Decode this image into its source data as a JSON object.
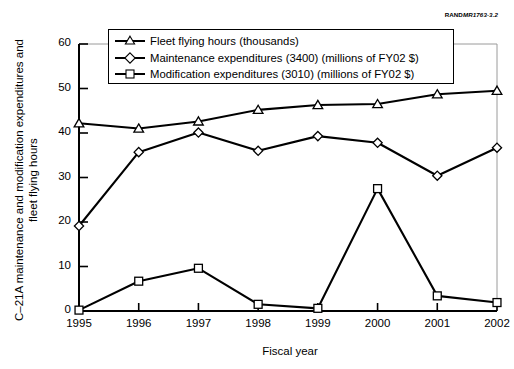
{
  "figure": {
    "source_tag_bold": "RAND",
    "source_tag_italic": "MR1763-3.2"
  },
  "chart_data": {
    "type": "line",
    "title": "",
    "xlabel": "Fiscal year",
    "ylabel": "C–21A maintenance and modification expenditures and fleet flying hours",
    "x": [
      1995,
      1996,
      1997,
      1998,
      1999,
      2000,
      2001,
      2002
    ],
    "categories": [
      "1995",
      "1996",
      "1997",
      "1998",
      "1999",
      "2000",
      "2001",
      "2002"
    ],
    "xlim": [
      1995,
      2002
    ],
    "ylim": [
      0,
      60
    ],
    "yticks": [
      0,
      10,
      20,
      30,
      40,
      50,
      60
    ],
    "grid": false,
    "legend_position": "top-center",
    "series": [
      {
        "name": "Fleet flying hours (thousands)",
        "marker": "triangle",
        "values": [
          42.2,
          41.0,
          42.6,
          45.2,
          46.3,
          46.5,
          48.7,
          49.5
        ]
      },
      {
        "name": "Maintenance expenditures (3400) (millions of FY02 $)",
        "marker": "diamond",
        "values": [
          19.1,
          35.7,
          40.1,
          36.0,
          39.3,
          37.8,
          30.4,
          36.7
        ]
      },
      {
        "name": "Modification expenditures (3010) (millions of FY02 $)",
        "marker": "square",
        "values": [
          0.2,
          6.7,
          9.6,
          1.5,
          0.6,
          27.5,
          3.4,
          1.9
        ]
      }
    ]
  },
  "axis_style": {
    "line_color": "#000000",
    "frame_color": "#9a9a9a",
    "marker_fill": "#ffffff"
  }
}
